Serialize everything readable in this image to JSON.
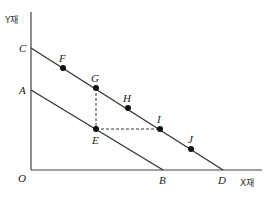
{
  "diagram": {
    "axes": {
      "y_label": "Y재",
      "x_label": "X재",
      "origin_label": "O"
    },
    "lines": [
      {
        "name": "budget-line-AB",
        "from": "A",
        "to": "B"
      },
      {
        "name": "budget-line-CD",
        "from": "C",
        "to": "D"
      }
    ],
    "intercept_labels": {
      "A": "A",
      "B": "B",
      "C": "C",
      "D": "D"
    },
    "points": [
      {
        "label": "F",
        "x": 63,
        "y": 68
      },
      {
        "label": "G",
        "x": 96,
        "y": 88
      },
      {
        "label": "H",
        "x": 128,
        "y": 108
      },
      {
        "label": "I",
        "x": 160,
        "y": 129
      },
      {
        "label": "J",
        "x": 191,
        "y": 149
      },
      {
        "label": "E",
        "x": 96,
        "y": 129
      }
    ],
    "dashed_segments": [
      "G-E",
      "E-I"
    ],
    "colors": {
      "line": "#333333",
      "point": "#111111"
    }
  }
}
